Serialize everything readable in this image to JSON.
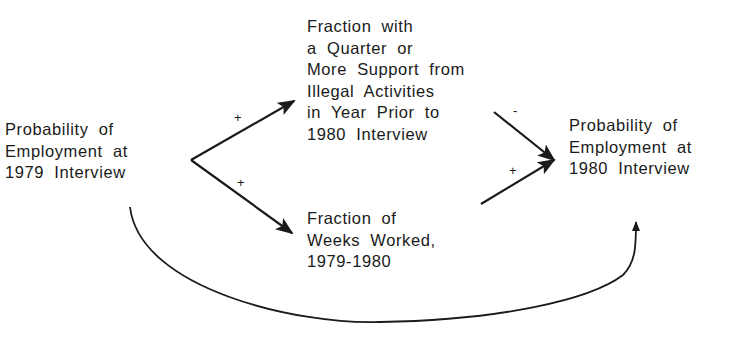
{
  "diagram": {
    "nodes": [
      {
        "id": "emp1979",
        "lines": [
          "Probability of",
          "Employment at",
          "1979 Interview"
        ]
      },
      {
        "id": "illegal",
        "lines": [
          "Fraction with",
          "a Quarter or",
          "More Support from",
          "Illegal Activities",
          "in Year Prior to",
          "1980 Interview"
        ]
      },
      {
        "id": "weeks",
        "lines": [
          "Fraction of",
          "Weeks Worked,",
          "1979-1980"
        ]
      },
      {
        "id": "emp1980",
        "lines": [
          "Probability of",
          "Employment at",
          "1980 Interview"
        ]
      }
    ],
    "edges": [
      {
        "from": "emp1979",
        "to": "illegal",
        "sign": "+"
      },
      {
        "from": "emp1979",
        "to": "weeks",
        "sign": "+"
      },
      {
        "from": "illegal",
        "to": "emp1980",
        "sign": "-"
      },
      {
        "from": "weeks",
        "to": "emp1980",
        "sign": "+"
      },
      {
        "from": "emp1979",
        "to": "emp1980",
        "sign": ""
      }
    ],
    "colors": {
      "ink": "#1a1a1a",
      "background": "#ffffff"
    }
  }
}
